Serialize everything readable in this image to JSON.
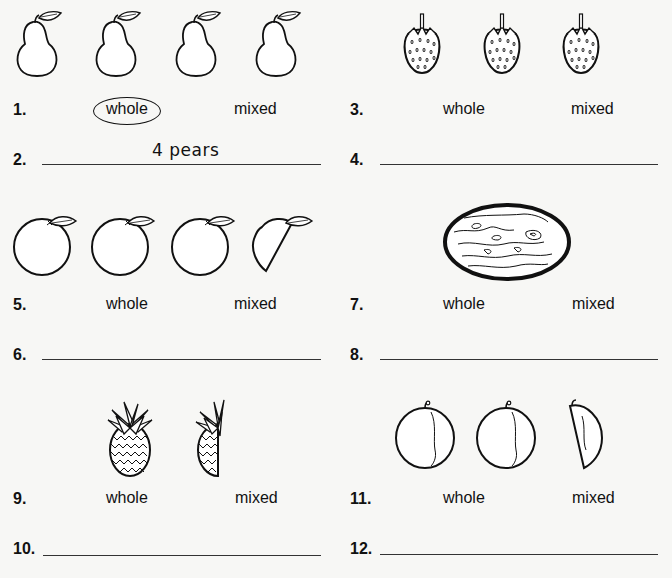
{
  "worksheet": {
    "problems": [
      {
        "id": "pears",
        "fruit": "pear",
        "count_whole": 4,
        "count_partial": 0,
        "choice_number": "1.",
        "answer_number": "2.",
        "options": [
          "whole",
          "mixed"
        ],
        "selected": "whole",
        "answer_text": "4 pears"
      },
      {
        "id": "strawberries",
        "fruit": "strawberry",
        "count_whole": 3,
        "count_partial": 0,
        "choice_number": "3.",
        "answer_number": "4.",
        "options": [
          "whole",
          "mixed"
        ],
        "selected": null,
        "answer_text": ""
      },
      {
        "id": "oranges",
        "fruit": "orange",
        "count_whole": 3,
        "count_partial": 1,
        "choice_number": "5.",
        "answer_number": "6.",
        "options": [
          "whole",
          "mixed"
        ],
        "selected": null,
        "answer_text": ""
      },
      {
        "id": "melon",
        "fruit": "melon",
        "count_whole": 1,
        "count_partial": 0,
        "choice_number": "7.",
        "answer_number": "8.",
        "options": [
          "whole",
          "mixed"
        ],
        "selected": null,
        "answer_text": ""
      },
      {
        "id": "pineapples",
        "fruit": "pineapple",
        "count_whole": 1,
        "count_partial": 1,
        "choice_number": "9.",
        "answer_number": "10.",
        "options": [
          "whole",
          "mixed"
        ],
        "selected": null,
        "answer_text": ""
      },
      {
        "id": "plums",
        "fruit": "plum",
        "count_whole": 2,
        "count_partial": 1,
        "choice_number": "11.",
        "answer_number": "12.",
        "options": [
          "whole",
          "mixed"
        ],
        "selected": null,
        "answer_text": ""
      }
    ]
  }
}
